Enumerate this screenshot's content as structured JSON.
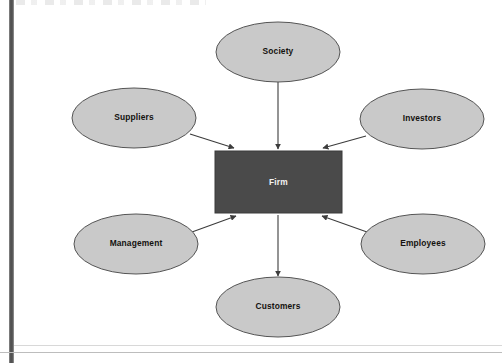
{
  "page": {
    "background_color": "#ffffff"
  },
  "diagram": {
    "type": "hub-and-spoke stakeholder diagram",
    "center": {
      "label": "Firm",
      "shape": "rectangle",
      "fill_color": "#4a4a4a",
      "text_color": "#f2f2f2",
      "x": 215,
      "y": 151,
      "width": 127,
      "height": 62
    },
    "nodes": [
      {
        "id": "society",
        "label": "Society",
        "shape": "ellipse",
        "fill_color": "#c9c9c9",
        "stroke_color": "#555555",
        "cx": 278,
        "cy": 52,
        "rx": 62,
        "ry": 30
      },
      {
        "id": "suppliers",
        "label": "Suppliers",
        "shape": "ellipse",
        "fill_color": "#c9c9c9",
        "stroke_color": "#555555",
        "cx": 134,
        "cy": 118,
        "rx": 62,
        "ry": 30
      },
      {
        "id": "investors",
        "label": "Investors",
        "shape": "ellipse",
        "fill_color": "#c9c9c9",
        "stroke_color": "#555555",
        "cx": 422,
        "cy": 119,
        "rx": 62,
        "ry": 30
      },
      {
        "id": "management",
        "label": "Management",
        "shape": "ellipse",
        "fill_color": "#c9c9c9",
        "stroke_color": "#555555",
        "cx": 136,
        "cy": 244,
        "rx": 62,
        "ry": 30
      },
      {
        "id": "employees",
        "label": "Employees",
        "shape": "ellipse",
        "fill_color": "#c9c9c9",
        "stroke_color": "#555555",
        "cx": 423,
        "cy": 244,
        "rx": 62,
        "ry": 30
      },
      {
        "id": "customers",
        "label": "Customers",
        "shape": "ellipse",
        "fill_color": "#c9c9c9",
        "stroke_color": "#555555",
        "cx": 278,
        "cy": 307,
        "rx": 62,
        "ry": 30
      }
    ],
    "edges": [
      {
        "id": "society-to-firm",
        "from": "society",
        "to": "firm",
        "direction": "in",
        "x1": 278,
        "y1": 82,
        "x2": 278,
        "y2": 149
      },
      {
        "id": "suppliers-to-firm",
        "from": "suppliers",
        "to": "firm",
        "direction": "in",
        "x1": 190,
        "y1": 134,
        "x2": 235,
        "y2": 149
      },
      {
        "id": "investors-to-firm",
        "from": "investors",
        "to": "firm",
        "direction": "in",
        "x1": 366,
        "y1": 136,
        "x2": 322,
        "y2": 149
      },
      {
        "id": "management-to-firm",
        "from": "management",
        "to": "firm",
        "direction": "in",
        "x1": 192,
        "y1": 232,
        "x2": 236,
        "y2": 215
      },
      {
        "id": "employees-to-firm",
        "from": "employees",
        "to": "firm",
        "direction": "in",
        "x1": 367,
        "y1": 232,
        "x2": 322,
        "y2": 215
      },
      {
        "id": "firm-to-customers",
        "from": "firm",
        "to": "customers",
        "direction": "out",
        "x1": 278,
        "y1": 215,
        "x2": 278,
        "y2": 276
      }
    ],
    "edge_color": "#3c3c3c"
  }
}
